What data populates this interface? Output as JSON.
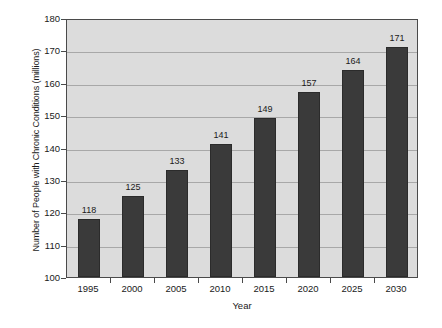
{
  "chart_data": {
    "type": "bar",
    "title": "",
    "xlabel": "Year",
    "ylabel": "Number of People with Chronic Conditions (millions)",
    "categories": [
      "1995",
      "2000",
      "2005",
      "2010",
      "2015",
      "2020",
      "2025",
      "2030"
    ],
    "values": [
      118,
      125,
      133,
      141,
      149,
      157,
      164,
      171
    ],
    "data_labels": [
      "118",
      "125",
      "133",
      "141",
      "149",
      "157",
      "164",
      "171"
    ],
    "ylim": [
      100,
      180
    ],
    "ytick_labels": [
      "180",
      "170",
      "160",
      "150",
      "140",
      "130",
      "120",
      "110",
      "100"
    ],
    "ytick_values": [
      180,
      170,
      160,
      150,
      140,
      130,
      120,
      110,
      100
    ],
    "ytick_step": 10,
    "grid": true,
    "grid_axis": "y",
    "legend": false,
    "legend_position": "none",
    "colors": {
      "bar": "#3a3a3a",
      "bar_edge": "#2b2b2b",
      "plot_background": "#dcdcdc",
      "figure_background": "#ffffff",
      "gridline": "#a8a8a8",
      "axis": "#4a4a4a",
      "text": "#1a1a1a"
    }
  }
}
